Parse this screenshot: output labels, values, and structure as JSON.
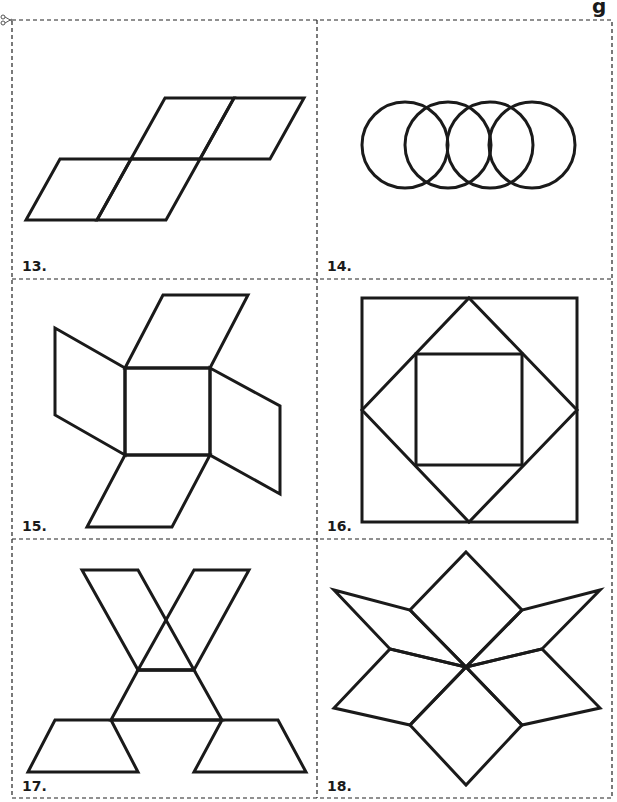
{
  "page": {
    "type": "pattern-block cut-out cards",
    "colors": {
      "ink": "#1a1a1a",
      "paper": "#ffffff"
    },
    "partial_header_text": "g"
  },
  "cards": [
    {
      "number": "13.",
      "figure": "four rhombi in a stepped parallelogram arrangement"
    },
    {
      "number": "14.",
      "figure": "four overlapping circles in a row"
    },
    {
      "number": "15.",
      "figure": "square with four rhombi pinwheel"
    },
    {
      "number": "16.",
      "figure": "square inside diamond inside square"
    },
    {
      "number": "17.",
      "figure": "X of rhombi over triangle with two trapezoids"
    },
    {
      "number": "18.",
      "figure": "star of six rhombi around a center point"
    }
  ],
  "icons": {
    "cut_marker": "scissors-icon"
  }
}
